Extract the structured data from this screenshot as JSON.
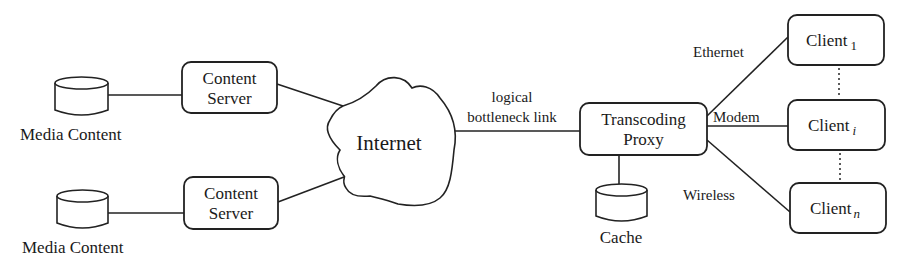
{
  "diagram": {
    "left": {
      "media_top": {
        "label": "Media Content"
      },
      "media_bottom": {
        "label": "Media Content"
      },
      "server_top": {
        "line1": "Content",
        "line2": "Server"
      },
      "server_bottom": {
        "line1": "Content",
        "line2": "Server"
      }
    },
    "center": {
      "cloud": {
        "label": "Internet"
      },
      "link": {
        "line1": "logical",
        "line2": "bottleneck link"
      }
    },
    "proxy": {
      "line1": "Transcoding",
      "line2": "Proxy",
      "cache": {
        "label": "Cache"
      }
    },
    "links": {
      "ethernet": "Ethernet",
      "modem": "Modem",
      "wireless": "Wireless"
    },
    "clients": [
      {
        "base": "Client",
        "subscript": "1"
      },
      {
        "base": "Client",
        "subscript": "i"
      },
      {
        "base": "Client",
        "subscript": "n"
      }
    ],
    "colors": {
      "stroke": "#222222",
      "background": "#ffffff",
      "text": "#1a1a1a"
    }
  }
}
